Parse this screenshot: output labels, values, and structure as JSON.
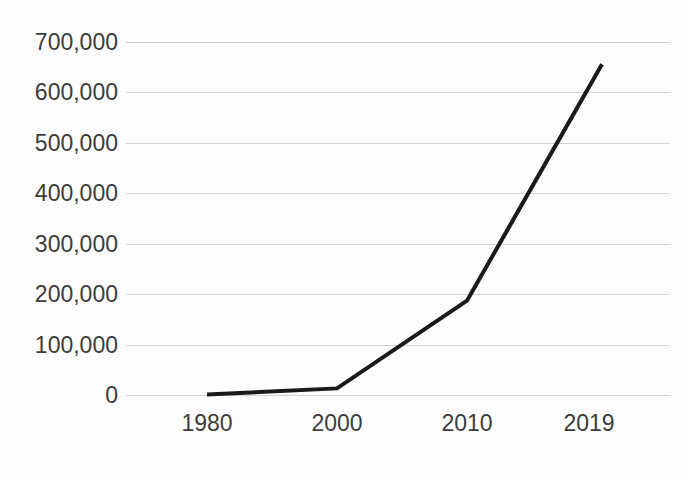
{
  "chart_data": {
    "type": "line",
    "title": "",
    "subtitle": "",
    "xlabel": "",
    "ylabel": "",
    "categories": [
      "1980",
      "2000",
      "2010",
      "2019"
    ],
    "x": [
      1980,
      2000,
      2010,
      2019
    ],
    "values": [
      1000,
      13000,
      187000,
      656000
    ],
    "series": [
      {
        "name": "",
        "values": [
          1000,
          13000,
          187000,
          656000
        ]
      }
    ],
    "ylim": [
      0,
      700000
    ],
    "yticks": [
      0,
      100000,
      200000,
      300000,
      400000,
      500000,
      600000,
      700000
    ],
    "ytick_labels": [
      "0",
      "100,000",
      "200,000",
      "300,000",
      "400,000",
      "500,000",
      "600,000",
      "700,000"
    ],
    "xtick_labels": [
      "1980",
      "2000",
      "2010",
      "2019"
    ],
    "grid": true,
    "grid_axis": "y",
    "legend": false,
    "legend_position": "none",
    "annotations": [],
    "colors": {
      "line": "#1a1a1a",
      "grid": "#d2d2d2",
      "background": "#fdfdfd",
      "tick_label": "#3c3c3c"
    },
    "line_width": 4,
    "markers": false
  },
  "geometry": {
    "plot_left": 126,
    "plot_right": 670,
    "y_zero_px": 395,
    "y_top_px": 42,
    "point_x_px": [
      207,
      337,
      467,
      602
    ]
  }
}
